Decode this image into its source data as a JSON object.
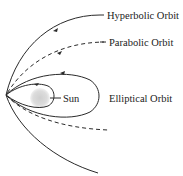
{
  "diagram": {
    "labels": {
      "hyperbolic": "Hyperbolic Orbit",
      "parabolic": "Parabolic Orbit",
      "elliptical": "Elliptical Orbit",
      "sun": "Sun"
    },
    "colors": {
      "line": "#2a2a2a",
      "sun": "#d0d0d0",
      "text": "#222222"
    }
  }
}
